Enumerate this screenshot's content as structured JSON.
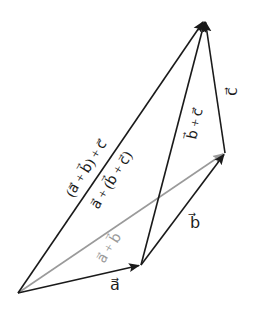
{
  "diagram": {
    "colors": {
      "black": "#1a1a1a",
      "gray": "#9a9a9a",
      "background": "#ffffff"
    },
    "points": {
      "O": [
        18,
        293
      ],
      "A": [
        141,
        265
      ],
      "B": [
        225,
        153
      ],
      "C": [
        205,
        20
      ]
    },
    "vectors": [
      {
        "name": "a",
        "from": "O",
        "to": "A",
        "color": "black",
        "label": "a⃗"
      },
      {
        "name": "b",
        "from": "A",
        "to": "B",
        "color": "black",
        "label": "b⃗"
      },
      {
        "name": "c",
        "from": "B",
        "to": "C",
        "color": "black",
        "label": "c⃗"
      },
      {
        "name": "a+b",
        "from": "O",
        "to": "B",
        "color": "gray",
        "label": "a⃗ + b⃗"
      },
      {
        "name": "b+c",
        "from": "A",
        "to": "C",
        "color": "black",
        "label": "b⃗ + c⃗"
      },
      {
        "name": "(a+b)+c",
        "from": "O",
        "to": "C",
        "color": "black",
        "label": "(a⃗ + b⃗) + c⃗"
      }
    ],
    "labels": {
      "a": "a⃗",
      "b": "b⃗",
      "c": "c⃗",
      "a_plus_b": "a⃗ + b⃗",
      "b_plus_c": "b⃗ + c⃗",
      "a_plus_b_then_c": "(a⃗ + b⃗) + c⃗",
      "a_plus_b_plus_c": "a⃗ + (b⃗ + c⃗)"
    }
  }
}
